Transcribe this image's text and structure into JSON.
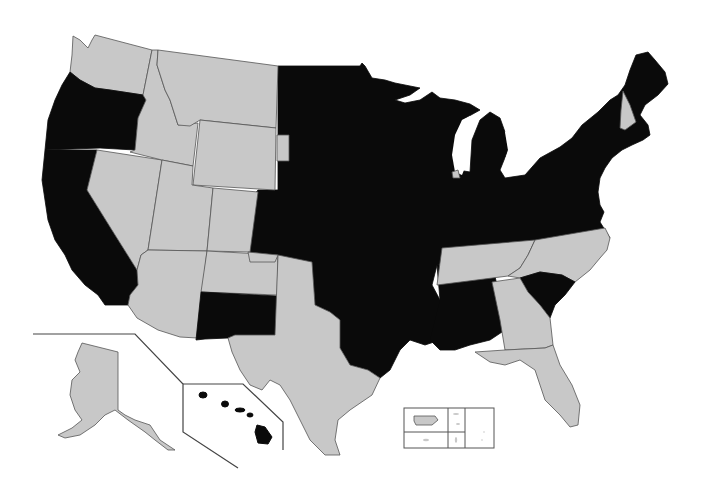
{
  "map": {
    "type": "choropleth",
    "region": "United States",
    "legend": [],
    "colors": {
      "category_a": "#0a0a0a",
      "category_b": "#c8c8c8",
      "background": "#ffffff",
      "border": "#555555"
    },
    "states": {
      "black": [
        "OR",
        "CA",
        "NM",
        "ND",
        "SD",
        "NE",
        "KS",
        "OK",
        "MN",
        "IA",
        "MO",
        "AR",
        "LA",
        "MS",
        "AL",
        "WI",
        "IL",
        "MI",
        "IN",
        "OH",
        "KY",
        "WV",
        "VA",
        "PA",
        "NY",
        "NJ",
        "DE",
        "MD",
        "CT",
        "RI",
        "MA",
        "VT",
        "ME",
        "SC",
        "HI"
      ],
      "gray": [
        "WA",
        "ID",
        "MT",
        "WY",
        "NV",
        "UT",
        "CO",
        "AZ",
        "TX",
        "TN",
        "NC",
        "GA",
        "FL",
        "NH",
        "AK",
        "PR"
      ]
    },
    "insets": [
      "Alaska",
      "Hawaii",
      "Puerto Rico and territories"
    ]
  }
}
